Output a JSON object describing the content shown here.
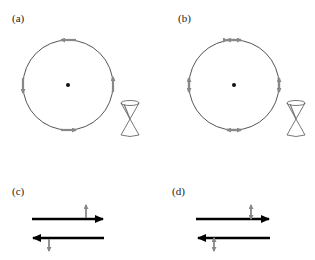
{
  "panels": [
    {
      "id": "a",
      "label": "(a)",
      "type": "circle",
      "arrow_style": "single",
      "circulation": "counterclockwise"
    },
    {
      "id": "b",
      "label": "(b)",
      "type": "circle",
      "arrow_style": "double"
    },
    {
      "id": "c",
      "label": "(c)",
      "type": "parallel-arrows",
      "marker_style": "single"
    },
    {
      "id": "d",
      "label": "(d)",
      "type": "parallel-arrows",
      "marker_style": "double"
    }
  ],
  "colors": {
    "circle_stroke": "#555555",
    "marker_gray": "#888888",
    "main_arrow": "#000000",
    "center_dot": "#111111"
  }
}
